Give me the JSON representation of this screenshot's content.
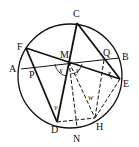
{
  "diagram": {
    "circle": {
      "cx": 70,
      "cy": 76,
      "r": 52
    },
    "points": {
      "C": {
        "x": 77,
        "y": 23,
        "label": "C",
        "lx": 73,
        "ly": 17
      },
      "F": {
        "x": 26,
        "y": 48,
        "label": "F",
        "lx": 17,
        "ly": 50
      },
      "A": {
        "x": 21,
        "y": 69,
        "label": "A",
        "lx": 9,
        "ly": 72
      },
      "B": {
        "x": 119,
        "y": 58,
        "label": "B",
        "lx": 122,
        "ly": 60
      },
      "E": {
        "x": 120,
        "y": 79,
        "label": "E",
        "lx": 123,
        "ly": 87
      },
      "D": {
        "x": 57,
        "y": 122,
        "label": "D",
        "lx": 51,
        "ly": 133
      },
      "N": {
        "x": 77,
        "y": 127,
        "label": "N",
        "lx": 73,
        "ly": 142
      },
      "H": {
        "x": 95,
        "y": 118,
        "label": "H",
        "lx": 96,
        "ly": 130
      },
      "M": {
        "x": 69,
        "y": 62,
        "label": "M",
        "lx": 60,
        "ly": 58
      },
      "P": {
        "x": 33,
        "y": 67,
        "label": "P",
        "lx": 29,
        "ly": 78
      },
      "Q": {
        "x": 106,
        "y": 60,
        "label": "Q",
        "lx": 103,
        "ly": 56
      }
    },
    "angle_labels": {
      "x": {
        "label": "x",
        "lx": 59,
        "ly": 73
      },
      "y": {
        "label": "y",
        "lx": 76,
        "ly": 73
      },
      "z": {
        "label": "z",
        "lx": 108,
        "ly": 76
      },
      "v": {
        "label": "v",
        "lx": 54,
        "ly": 110
      },
      "w": {
        "label": "w",
        "lx": 88,
        "ly": 100
      }
    }
  }
}
